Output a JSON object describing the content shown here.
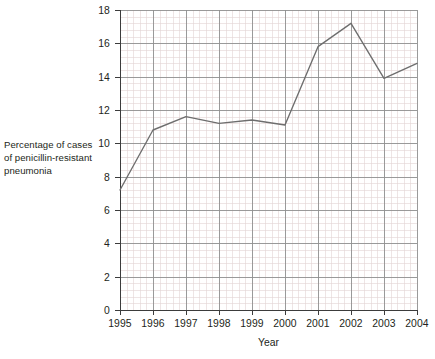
{
  "chart_data": {
    "type": "line",
    "title": "",
    "xlabel": "Year",
    "ylabel": "Percentage of cases of penicillin-resistant pneumonia",
    "ylabel_lines": [
      "Percentage of cases",
      "of penicillin-resistant",
      "pneumonia"
    ],
    "categories": [
      1995,
      1996,
      1997,
      1998,
      1999,
      2000,
      2001,
      2002,
      2003,
      2004
    ],
    "x_tick_labels": [
      "1995",
      "1996",
      "1997",
      "1998",
      "1999",
      "2000",
      "2001",
      "2002",
      "2003",
      "2004"
    ],
    "values": [
      7.2,
      10.8,
      11.6,
      11.2,
      11.4,
      11.1,
      15.8,
      17.2,
      13.9,
      14.8
    ],
    "series": [
      {
        "name": "Percentage of cases of penicillin-resistant pneumonia",
        "values": [
          7.2,
          10.8,
          11.6,
          11.2,
          11.4,
          11.1,
          15.8,
          17.2,
          13.9,
          14.8
        ]
      }
    ],
    "xlim": [
      1995,
      2004
    ],
    "ylim": [
      0,
      18
    ],
    "y_tick_values": [
      0,
      2,
      4,
      6,
      8,
      10,
      12,
      14,
      16,
      18
    ],
    "y_tick_labels": [
      "0",
      "2",
      "4",
      "6",
      "8",
      "10",
      "12",
      "14",
      "16",
      "18"
    ],
    "y_tick_step": 2,
    "grid": true,
    "minor_grid": true,
    "minor_divisions_x": 5,
    "minor_divisions_y": 5,
    "legend": "none",
    "markers": "none"
  },
  "colors": {
    "line": "#6e6e6e",
    "major_grid": "#8f8f8f",
    "minor_grid": "#e2d3d3",
    "axis": "#3c3c3c",
    "text": "#231f20",
    "background": "#ffffff"
  },
  "plot": {
    "left": 120,
    "right": 417,
    "top": 10,
    "bottom": 310
  },
  "header": {
    "cropped_title": ""
  }
}
